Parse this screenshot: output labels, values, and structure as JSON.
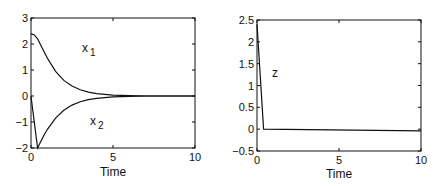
{
  "chart_data": [
    {
      "type": "line",
      "title": "",
      "xlabel": "Time",
      "ylabel": "",
      "xlim": [
        0,
        10
      ],
      "ylim": [
        -2,
        3
      ],
      "xticks": [
        "0",
        "5",
        "10"
      ],
      "yticks": [
        "-2",
        "-1",
        "0",
        "1",
        "2",
        "3"
      ],
      "grid": false,
      "legend": "inline labels",
      "series": [
        {
          "name": "x1",
          "label_main": "x",
          "label_sub": "1",
          "x": [
            0,
            0.2,
            0.4,
            0.6,
            0.8,
            1.0,
            1.5,
            2.0,
            2.5,
            3.0,
            3.5,
            4.0,
            5.0,
            6.0,
            7.0,
            8.0,
            10.0
          ],
          "y": [
            2.4,
            2.35,
            2.2,
            1.95,
            1.7,
            1.45,
            0.95,
            0.6,
            0.38,
            0.24,
            0.15,
            0.09,
            0.03,
            0.01,
            0.0,
            0.0,
            0.0
          ]
        },
        {
          "name": "x2",
          "label_main": "x",
          "label_sub": "2",
          "x": [
            0,
            0.1,
            0.2,
            0.3,
            0.4,
            0.6,
            0.8,
            1.0,
            1.5,
            2.0,
            2.5,
            3.0,
            3.5,
            4.0,
            5.0,
            6.0,
            7.0,
            10.0
          ],
          "y": [
            0,
            -0.5,
            -1.0,
            -1.5,
            -2.0,
            -1.75,
            -1.5,
            -1.28,
            -0.85,
            -0.55,
            -0.35,
            -0.22,
            -0.14,
            -0.09,
            -0.03,
            -0.01,
            0.0,
            0.0
          ]
        }
      ]
    },
    {
      "type": "line",
      "title": "",
      "xlabel": "Time",
      "ylabel": "",
      "xlim": [
        0,
        10
      ],
      "ylim": [
        -0.5,
        2.5
      ],
      "xticks": [
        "0",
        "5",
        "10"
      ],
      "yticks": [
        "-0.5",
        "0",
        "0.5",
        "1",
        "1.5",
        "2",
        "2.5"
      ],
      "grid": false,
      "legend": "inline labels",
      "series": [
        {
          "name": "z",
          "label_main": "z",
          "x": [
            0,
            0.4,
            10
          ],
          "y": [
            2.4,
            0.0,
            -0.04
          ]
        }
      ]
    }
  ]
}
